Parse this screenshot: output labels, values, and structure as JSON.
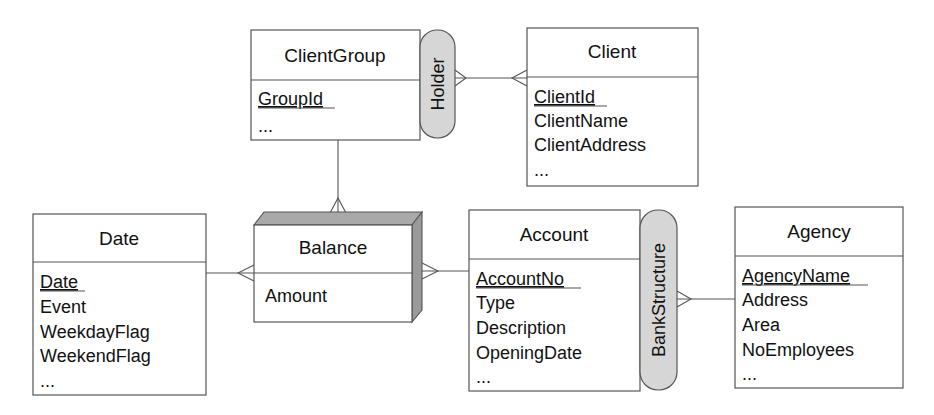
{
  "entities": {
    "client_group": {
      "title": "ClientGroup",
      "attributes": [
        "GroupId",
        "..."
      ],
      "key": "GroupId"
    },
    "client": {
      "title": "Client",
      "attributes": [
        "ClientId",
        "ClientName",
        "ClientAddress",
        "..."
      ],
      "key": "ClientId"
    },
    "date": {
      "title": "Date",
      "attributes": [
        "Date",
        "Event",
        "WeekdayFlag",
        "WeekendFlag",
        "..."
      ],
      "key": "Date"
    },
    "balance": {
      "title": "Balance",
      "attributes": [
        "Amount"
      ],
      "type": "fact"
    },
    "account": {
      "title": "Account",
      "attributes": [
        "AccountNo",
        "Type",
        "Description",
        "OpeningDate",
        "..."
      ],
      "key": "AccountNo"
    },
    "agency": {
      "title": "Agency",
      "attributes": [
        "AgencyName",
        "Address",
        "Area",
        "NoEmployees",
        "..."
      ],
      "key": "AgencyName"
    }
  },
  "relationships": {
    "holder": {
      "label": "Holder",
      "from": "Client",
      "to": "ClientGroup",
      "cardinality": "many-to-many"
    },
    "bank_structure": {
      "label": "BankStructure",
      "from": "Account",
      "to": "Agency",
      "cardinality": "many-to-one"
    }
  },
  "links": [
    {
      "from": "ClientGroup",
      "to": "Balance",
      "many_end": "Balance"
    },
    {
      "from": "Date",
      "to": "Balance",
      "many_end": "Balance"
    },
    {
      "from": "Account",
      "to": "Balance",
      "many_end": "Balance"
    }
  ],
  "colors": {
    "line": "#555555",
    "pill_fill": "#d6d6d6",
    "fact_shade": "#a9a9a9"
  }
}
